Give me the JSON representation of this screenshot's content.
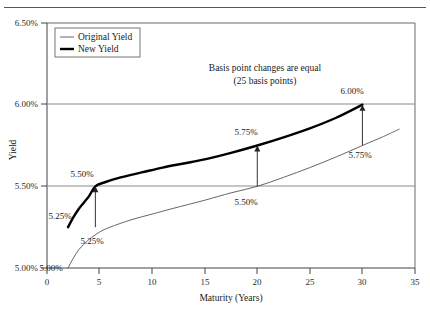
{
  "chart_data": {
    "type": "line",
    "title": "",
    "xlabel": "Maturity (Years)",
    "ylabel": "Yield",
    "xlim": [
      0,
      35
    ],
    "ylim": [
      5.0,
      6.5
    ],
    "grid": true,
    "gridlines_y": [
      "5.50%",
      "6.00%"
    ],
    "legend_position": "top-left",
    "xticks": [
      "0",
      "5",
      "10",
      "15",
      "20",
      "25",
      "30",
      "35"
    ],
    "xtick_values": [
      0,
      5,
      10,
      15,
      20,
      25,
      30,
      35
    ],
    "yticks": [
      "5.00%",
      "5.50%",
      "6.00%",
      "6.50%"
    ],
    "ytick_values": [
      5.0,
      5.5,
      6.0,
      6.5
    ],
    "series": [
      {
        "name": "Original Yield",
        "style": "thin",
        "points": [
          [
            2.0,
            5.0
          ],
          [
            2.5,
            5.06
          ],
          [
            3.0,
            5.11
          ],
          [
            3.5,
            5.145
          ],
          [
            4.0,
            5.175
          ],
          [
            5.0,
            5.22
          ],
          [
            6.0,
            5.25
          ],
          [
            8.0,
            5.295
          ],
          [
            10.0,
            5.33
          ],
          [
            12.0,
            5.365
          ],
          [
            15.0,
            5.415
          ],
          [
            17.5,
            5.46
          ],
          [
            20.0,
            5.5
          ],
          [
            22.5,
            5.555
          ],
          [
            25.0,
            5.615
          ],
          [
            27.5,
            5.68
          ],
          [
            30.0,
            5.75
          ],
          [
            32.0,
            5.805
          ],
          [
            33.5,
            5.85
          ]
        ]
      },
      {
        "name": "New Yield",
        "style": "thick",
        "points": [
          [
            2.0,
            5.25
          ],
          [
            2.5,
            5.31
          ],
          [
            3.0,
            5.36
          ],
          [
            3.5,
            5.4
          ],
          [
            4.0,
            5.44
          ],
          [
            4.6,
            5.5
          ],
          [
            5.5,
            5.525
          ],
          [
            7.0,
            5.555
          ],
          [
            9.0,
            5.585
          ],
          [
            11.0,
            5.615
          ],
          [
            13.0,
            5.64
          ],
          [
            15.0,
            5.665
          ],
          [
            17.5,
            5.705
          ],
          [
            20.0,
            5.75
          ],
          [
            22.5,
            5.8
          ],
          [
            25.0,
            5.855
          ],
          [
            27.5,
            5.92
          ],
          [
            30.0,
            6.0
          ]
        ]
      }
    ],
    "arrows": [
      {
        "x": 4.6,
        "from": 5.25,
        "to": 5.5,
        "label_top": "5.50%",
        "label_bottom": "5.25%"
      },
      {
        "x": 20.0,
        "from": 5.5,
        "to": 5.75,
        "label_top": "5.75%",
        "label_bottom": "5.50%"
      },
      {
        "x": 30.0,
        "from": 5.75,
        "to": 6.0,
        "label_top": "6.00%",
        "label_bottom": "5.75%"
      }
    ],
    "point_labels": [
      {
        "text": "5.25%",
        "x_px": 60,
        "y_px": 219,
        "name": "label-new-yield-start"
      },
      {
        "text": "5.00%",
        "x_px": 51,
        "y_px": 271,
        "name": "label-original-yield-start"
      },
      {
        "text": "5.50%",
        "x_px": 82,
        "y_px": 177,
        "name": "label-arrow1-top"
      },
      {
        "text": "5.25%",
        "x_px": 92,
        "y_px": 244,
        "name": "label-arrow1-bottom"
      },
      {
        "text": "5.75%",
        "x_px": 246,
        "y_px": 135,
        "name": "label-arrow2-top"
      },
      {
        "text": "5.50%",
        "x_px": 246,
        "y_px": 205,
        "name": "label-arrow2-bottom"
      },
      {
        "text": "6.00%",
        "x_px": 352,
        "y_px": 94,
        "name": "label-arrow3-top"
      },
      {
        "text": "5.75%",
        "x_px": 360,
        "y_px": 158,
        "name": "label-arrow3-bottom"
      }
    ],
    "annotation": {
      "line1": "Basis point changes are equal",
      "line2": "(25 basis points)"
    },
    "legend_entries": [
      {
        "label": "Original Yield",
        "style": "thin"
      },
      {
        "label": "New Yield",
        "style": "thick"
      }
    ]
  },
  "colors": {
    "axis": "#444444",
    "grid": "#8a8a8a",
    "original_yield": "#555555",
    "new_yield": "#000000",
    "text": "#1a1a1a",
    "background": "#ffffff"
  }
}
